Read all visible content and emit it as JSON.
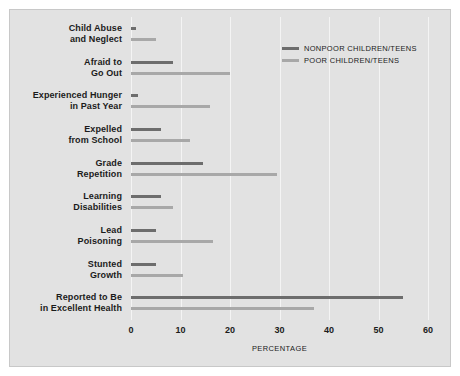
{
  "chart_data": {
    "type": "bar",
    "orientation": "horizontal",
    "title": "",
    "xlabel": "PERCENTAGE",
    "ylabel": "",
    "xlim": [
      0,
      60
    ],
    "xticks": [
      0,
      10,
      20,
      30,
      40,
      50,
      60
    ],
    "grid": true,
    "legend_position": "top-right",
    "categories": [
      "Child Abuse and Neglect",
      "Afraid to Go Out",
      "Experienced Hunger in Past Year",
      "Expelled from School",
      "Grade Repetition",
      "Learning Disabilities",
      "Lead Poisoning",
      "Stunted Growth",
      "Reported to Be in Excellent Health"
    ],
    "category_lines": [
      [
        "Child Abuse",
        "and Neglect"
      ],
      [
        "Afraid to",
        "Go Out"
      ],
      [
        "Experienced Hunger",
        "in Past Year"
      ],
      [
        "Expelled",
        "from School"
      ],
      [
        "Grade",
        "Repetition"
      ],
      [
        "Learning",
        "Disabilities"
      ],
      [
        "Lead",
        "Poisoning"
      ],
      [
        "Stunted",
        "Growth"
      ],
      [
        "Reported to Be",
        "in Excellent Health"
      ]
    ],
    "series": [
      {
        "name": "NONPOOR CHILDREN/TEENS",
        "color": "#6d6d6d",
        "values": [
          1.0,
          8.5,
          1.5,
          6.0,
          14.5,
          6.0,
          5.0,
          5.0,
          55.0
        ]
      },
      {
        "name": "POOR CHILDREN/TEENS",
        "color": "#a8a8a8",
        "values": [
          5.0,
          20.0,
          16.0,
          12.0,
          29.5,
          8.5,
          16.5,
          10.5,
          37.0
        ]
      }
    ]
  },
  "legend": {
    "items": [
      {
        "label": "NONPOOR CHILDREN/TEENS",
        "swatch": "nonpoor"
      },
      {
        "label": "POOR CHILDREN/TEENS",
        "swatch": "poor"
      }
    ]
  },
  "axis": {
    "x_title": "PERCENTAGE",
    "tick_labels": [
      "0",
      "10",
      "20",
      "30",
      "40",
      "50",
      "60"
    ]
  },
  "colors": {
    "background": "#e2e2e2",
    "page": "#ffffff",
    "gridline": "#f4f4f4",
    "nonpoor": "#6d6d6d",
    "poor": "#a8a8a8",
    "text": "#1b1b1b"
  }
}
